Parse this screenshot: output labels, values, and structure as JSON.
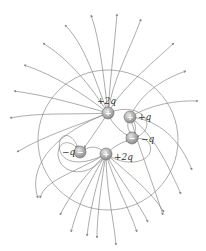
{
  "diagram": {
    "type": "electric-field-lines",
    "charges": [
      {
        "id": "c1",
        "label": "+2q",
        "sign": "+",
        "x": 108,
        "y": 113,
        "lx": 97,
        "ly": 104
      },
      {
        "id": "c2",
        "label": "+q",
        "sign": "+",
        "x": 130,
        "y": 117,
        "lx": 138,
        "ly": 120
      },
      {
        "id": "c3",
        "label": "−q",
        "sign": "−",
        "x": 132,
        "y": 138,
        "lx": 141,
        "ly": 142
      },
      {
        "id": "c4",
        "label": "+2q",
        "sign": "+",
        "x": 106,
        "y": 154,
        "lx": 114,
        "ly": 160
      },
      {
        "id": "c5",
        "label": "−q",
        "sign": "−",
        "x": 80,
        "y": 152,
        "lx": 62,
        "ly": 155
      }
    ],
    "colors": {
      "line": "#8a8a8a",
      "charge_fill": "#a8a8a8",
      "charge_stroke": "#6d6d6d"
    }
  }
}
